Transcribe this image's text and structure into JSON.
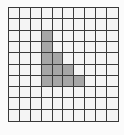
{
  "diagram": {
    "type": "grid",
    "rows": 10,
    "cols": 10,
    "colors": {
      "empty": "#f4f4f4",
      "filled": "#a6a6a6",
      "line": "#3a3a3a"
    },
    "filled_cells": [
      [
        2,
        3
      ],
      [
        3,
        3
      ],
      [
        4,
        3
      ],
      [
        4,
        4
      ],
      [
        5,
        3
      ],
      [
        5,
        4
      ],
      [
        5,
        5
      ],
      [
        6,
        3
      ],
      [
        6,
        4
      ],
      [
        6,
        5
      ],
      [
        6,
        6
      ]
    ]
  }
}
